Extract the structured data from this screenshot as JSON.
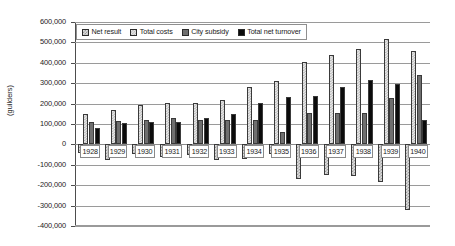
{
  "axis": {
    "y_title": "(guilders)",
    "y_ticks": [
      "600,000",
      "500,000",
      "400,000",
      "300,000",
      "200,000",
      "100,000",
      "0",
      "-100,000",
      "-200,000",
      "-300,000",
      "-400,000"
    ]
  },
  "legend": {
    "items": [
      {
        "label": "Net result",
        "swatch": "checker-light"
      },
      {
        "label": "Total costs",
        "swatch": "checker-lighter"
      },
      {
        "label": "City subsidy",
        "swatch": "solid-gray"
      },
      {
        "label": "Total net turnover",
        "swatch": "solid-black"
      }
    ]
  },
  "chart_data": {
    "type": "bar",
    "title": "",
    "xlabel": "",
    "ylabel": "(guilders)",
    "ylim": [
      -400000,
      600000
    ],
    "ytick_step": 100000,
    "grid": true,
    "legend_position": "top-inside",
    "categories": [
      "1928",
      "1929",
      "1930",
      "1931",
      "1932",
      "1933",
      "1934",
      "1935",
      "1936",
      "1937",
      "1938",
      "1939",
      "1940"
    ],
    "series": [
      {
        "name": "Net result",
        "values": [
          -42000,
          -77000,
          -45000,
          -60000,
          -52000,
          -78000,
          -73000,
          -48000,
          -168000,
          -150000,
          -155000,
          -185000,
          -320000
        ]
      },
      {
        "name": "Total costs",
        "values": [
          148000,
          168000,
          192000,
          205000,
          205000,
          218000,
          282000,
          312000,
          402000,
          440000,
          468000,
          515000,
          460000
        ]
      },
      {
        "name": "City subsidy",
        "values": [
          108000,
          115000,
          122000,
          128000,
          122000,
          118000,
          122000,
          62000,
          152000,
          152000,
          155000,
          228000,
          338000
        ]
      },
      {
        "name": "Total net turnover",
        "values": [
          78000,
          105000,
          112000,
          112000,
          128000,
          148000,
          205000,
          232000,
          238000,
          282000,
          318000,
          298000,
          118000
        ]
      }
    ]
  }
}
